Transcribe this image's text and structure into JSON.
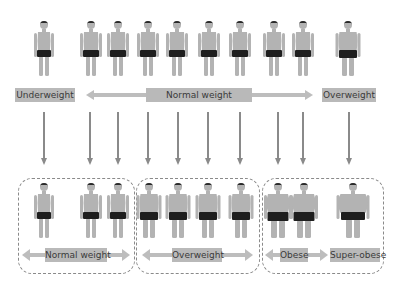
{
  "top_row": {
    "figures": [
      {
        "x": 44,
        "build": "thin"
      },
      {
        "x": 91,
        "build": "normal"
      },
      {
        "x": 118,
        "build": "normal"
      },
      {
        "x": 148,
        "build": "normal"
      },
      {
        "x": 177,
        "build": "normal"
      },
      {
        "x": 209,
        "build": "normal"
      },
      {
        "x": 240,
        "build": "normal"
      },
      {
        "x": 274,
        "build": "normal"
      },
      {
        "x": 303,
        "build": "normal"
      },
      {
        "x": 348,
        "build": "heavy"
      }
    ],
    "labels": {
      "underweight": "Underweight",
      "normal_weight": "Normal weight",
      "overweight": "Overweight"
    }
  },
  "arrows_x": [
    44,
    90,
    118,
    148,
    178,
    208,
    240,
    278,
    303,
    349
  ],
  "bottom_row": {
    "groups": [
      {
        "name": "normal-weight",
        "label": "Normal weight"
      },
      {
        "name": "overweight",
        "label": "Overweight"
      },
      {
        "name": "obese",
        "label": "Obese"
      },
      {
        "name": "super-obese",
        "label": "Super-obese"
      }
    ],
    "figures": [
      {
        "x": 44,
        "build": "thin"
      },
      {
        "x": 91,
        "build": "normal"
      },
      {
        "x": 118,
        "build": "normal"
      },
      {
        "x": 149,
        "build": "heavy"
      },
      {
        "x": 178,
        "build": "heavy"
      },
      {
        "x": 208,
        "build": "heavy"
      },
      {
        "x": 241,
        "build": "heavy"
      },
      {
        "x": 278,
        "build": "obese"
      },
      {
        "x": 304,
        "build": "obese"
      },
      {
        "x": 353,
        "build": "superobese"
      }
    ]
  },
  "colors": {
    "skin": "#b3b3b3",
    "hair": "#2a2a2a",
    "shorts": "#1e1e1e",
    "label_bg": "#b9b9b9",
    "arrow": "#8a8a8a",
    "bar_arrow": "#bdbdbd"
  }
}
